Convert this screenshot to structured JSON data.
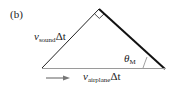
{
  "panel_label": "(b)",
  "labels": {
    "left_side": {
      "var": "v",
      "sub": "sound",
      "suffix": "Δt"
    },
    "base": {
      "var": "v",
      "sub": "airplane",
      "suffix": "Δt"
    },
    "angle": {
      "var": "θ",
      "sub": "M"
    }
  },
  "colors": {
    "hypotenuse": "#111111",
    "left_side": "#222222",
    "base": "#9a9a9a",
    "arrow": "#777777"
  }
}
